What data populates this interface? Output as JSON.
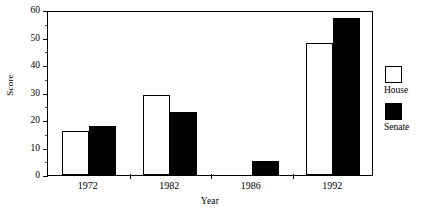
{
  "chart_data": {
    "type": "bar",
    "title": "",
    "subtitle": "",
    "xlabel": "Year",
    "ylabel": "Score",
    "categories": [
      "1972",
      "1982",
      "1986",
      "1992"
    ],
    "series": [
      {
        "name": "House",
        "values": [
          16,
          29,
          0,
          48
        ],
        "color": "#ffffff"
      },
      {
        "name": "Senate",
        "values": [
          18,
          23,
          5,
          57
        ],
        "color": "#000000"
      }
    ],
    "ylim": [
      0,
      60
    ],
    "ytick_major": [
      0,
      10,
      20,
      30,
      40,
      50,
      60
    ],
    "ytick_minor": [
      5,
      15,
      25,
      35,
      45,
      55
    ],
    "ytick_labels": [
      "0",
      "10",
      "20",
      "30",
      "40",
      "50",
      "60"
    ],
    "grid": false,
    "frame": true,
    "legend_position": "right",
    "legend_entries": [
      {
        "label": "House",
        "swatch": "hollow-square"
      },
      {
        "label": "Senate",
        "swatch": "filled-square"
      }
    ]
  },
  "axes": {
    "ylabel": "Score",
    "xlabel": "Year"
  },
  "legend": {
    "house_label": "House",
    "senate_label": "Senate"
  },
  "caption": {
    "sliver_text": ""
  }
}
